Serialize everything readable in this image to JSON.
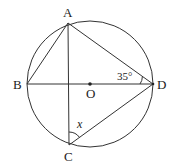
{
  "diagram": {
    "circle": {
      "center": "O",
      "cx": 90,
      "cy": 84,
      "r": 63
    },
    "points": {
      "A": {
        "label": "A",
        "x": 68,
        "y": 23
      },
      "B": {
        "label": "B",
        "x": 27,
        "y": 84
      },
      "C": {
        "label": "C",
        "x": 69,
        "y": 145
      },
      "D": {
        "label": "D",
        "x": 153,
        "y": 84
      },
      "O": {
        "label": "O",
        "x": 90,
        "y": 84
      }
    },
    "segments": [
      "AB",
      "AD",
      "AC",
      "BD",
      "CD"
    ],
    "angles": {
      "ADB": {
        "label": "35°"
      },
      "ACD": {
        "label": "x"
      }
    }
  }
}
